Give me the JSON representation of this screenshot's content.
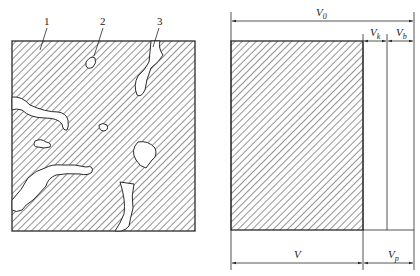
{
  "left_figure": {
    "title": "Porous material cross-section",
    "callouts": [
      {
        "id": "callout-1",
        "label": "1",
        "meaning": "solid material"
      },
      {
        "id": "callout-2",
        "label": "2",
        "meaning": "closed pore"
      },
      {
        "id": "callout-3",
        "label": "3",
        "meaning": "open pore"
      }
    ]
  },
  "right_figure": {
    "title": "Volume composition",
    "dimensions": {
      "total": {
        "symbol": "V",
        "subscript": "0"
      },
      "closed_pores": {
        "symbol": "V",
        "subscript": "k"
      },
      "open_pores": {
        "symbol": "V",
        "subscript": "b"
      },
      "solid": {
        "symbol": "V",
        "subscript": ""
      },
      "pores": {
        "symbol": "V",
        "subscript": "p"
      }
    }
  },
  "colors": {
    "line": "#2a2a2a",
    "hatch": "#3a3a3a",
    "background": "#ffffff"
  }
}
